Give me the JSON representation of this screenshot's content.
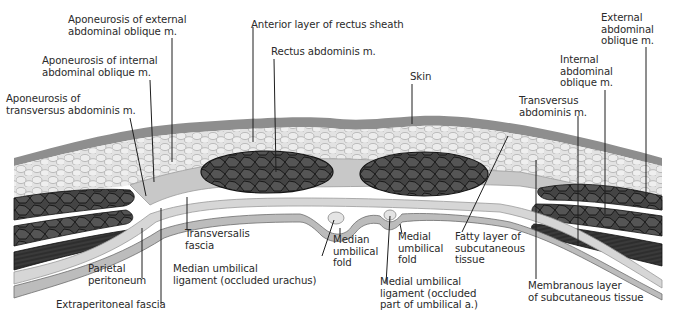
{
  "figure": {
    "colors": {
      "skin": "#8c8c8c",
      "fat": "#dcdcdc",
      "fat_cell_outline": "#a9a9a9",
      "fascia": "#c4c4c4",
      "muscle": "#3c3c3c",
      "muscle_lines": "#141414",
      "peritoneum": "#b5b5b5",
      "background": "#ffffff",
      "leader_line": "#1e1e1e",
      "label_text": "#2a2a2a"
    }
  },
  "labels": {
    "aponeurosis_external": "Aponeurosis of external\nabdominal oblique m.",
    "aponeurosis_internal": "Aponeurosis of internal\nabdominal oblique m.",
    "aponeurosis_transversus": "Aponeurosis of\ntransversus abdominis m.",
    "anterior_rectus_sheath": "Anterior layer of rectus sheath",
    "rectus_abdominis": "Rectus abdominis m.",
    "skin": "Skin",
    "external_oblique": "External\nabdominal\noblique m.",
    "internal_oblique": "Internal\nabdominal\noblique m.",
    "transversus_abdominis": "Transversus\nabdominis m.",
    "transversalis_fascia": "Transversalis\nfascia",
    "parietal_peritoneum": "Parietal\nperitoneum",
    "extraperitoneal_fascia": "Extraperitoneal fascia",
    "median_umbilical_ligament": "Median umbilical\nligament (occluded urachus)",
    "median_umbilical_fold": "Median\numbilical\nfold",
    "medial_umbilical_fold": "Medial\numbilical\nfold",
    "medial_umbilical_ligament": "Medial umbilical\nligament (occluded\npart of umbilical a.)",
    "fatty_layer": "Fatty layer of\nsubcutaneous\ntissue",
    "membranous_layer": "Membranous layer\nof subcutaneous tissue"
  }
}
